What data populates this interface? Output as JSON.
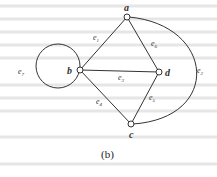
{
  "figure": {
    "caption": "(b)",
    "nodes": [
      {
        "id": "a",
        "label": "a",
        "x": 127,
        "y": 17
      },
      {
        "id": "b",
        "label": "b",
        "x": 80,
        "y": 70
      },
      {
        "id": "c",
        "label": "c",
        "x": 131,
        "y": 124
      },
      {
        "id": "d",
        "label": "d",
        "x": 159,
        "y": 72
      }
    ],
    "edges": [
      {
        "id": "e1",
        "label": "e",
        "sub": "1",
        "from": "a",
        "to": "b"
      },
      {
        "id": "e2",
        "label": "e",
        "sub": "2",
        "from": "a",
        "to": "c"
      },
      {
        "id": "e3",
        "label": "e",
        "sub": "3",
        "from": "b",
        "to": "d"
      },
      {
        "id": "e4",
        "label": "e",
        "sub": "4",
        "from": "b",
        "to": "c"
      },
      {
        "id": "e5",
        "label": "e",
        "sub": "5",
        "from": "c",
        "to": "d"
      },
      {
        "id": "e6",
        "label": "e",
        "sub": "6",
        "from": "a",
        "to": "d"
      },
      {
        "id": "e7",
        "label": "e",
        "sub": "7",
        "from": "b",
        "to": "b"
      }
    ]
  }
}
